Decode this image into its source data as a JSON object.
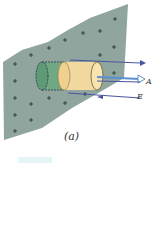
{
  "figure": {
    "caption": "(a)",
    "vector_a": "A",
    "vector_e": "E",
    "colors": {
      "plane": "#8fa59d",
      "cylinder_green": "#6fa883",
      "cylinder_yellow": "#f2d9a0",
      "arrow": "#4a55a0",
      "arrow_a": "#5b8fd0"
    }
  }
}
